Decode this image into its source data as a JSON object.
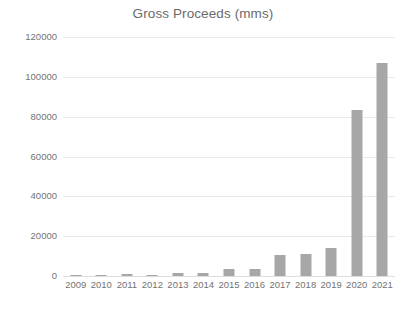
{
  "chart_data": {
    "type": "bar",
    "title": "Gross Proceeds (mms)",
    "xlabel": "",
    "ylabel": "",
    "categories": [
      "2009",
      "2010",
      "2011",
      "2012",
      "2013",
      "2014",
      "2015",
      "2016",
      "2017",
      "2018",
      "2019",
      "2020",
      "2021"
    ],
    "values": [
      300,
      700,
      1000,
      250,
      1600,
      1700,
      3500,
      3300,
      10500,
      11000,
      14000,
      83500,
      107000
    ],
    "series": [
      {
        "name": "Gross Proceeds (mms)",
        "values": [
          300,
          700,
          1000,
          250,
          1600,
          1700,
          3500,
          3300,
          10500,
          11000,
          14000,
          83500,
          107000
        ]
      }
    ],
    "ylim": [
      0,
      120000
    ],
    "y_ticks": [
      0,
      20000,
      40000,
      60000,
      80000,
      100000,
      120000
    ],
    "y_tick_labels": [
      "0",
      "20000",
      "40000",
      "60000",
      "80000",
      "100000",
      "120000"
    ],
    "grid": true,
    "grid_axis": "y",
    "legend": false,
    "legend_position": "none",
    "bar_color": "#a7a7a7",
    "gridline_color": "#e9e9e9",
    "background_color": "#ffffff",
    "text_color": "#737373"
  }
}
